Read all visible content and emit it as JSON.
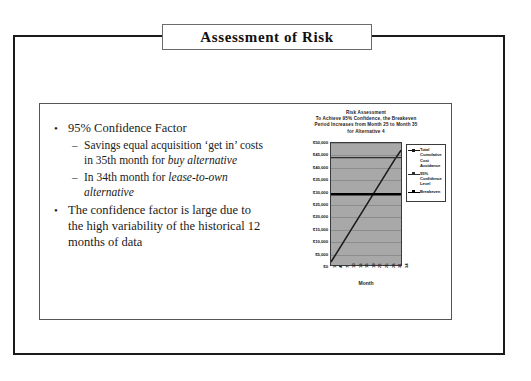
{
  "slide": {
    "title": "Assessment of Risk"
  },
  "bullets": [
    {
      "level": 1,
      "marker": "•",
      "segments": [
        {
          "text": "95% Confidence Factor",
          "style": "normal"
        }
      ]
    },
    {
      "level": 2,
      "marker": "–",
      "segments": [
        {
          "text": "Savings equal acquisition ‘get in’ costs in 35th month for ",
          "style": "normal"
        },
        {
          "text": "buy alternative",
          "style": "italic"
        }
      ]
    },
    {
      "level": 2,
      "marker": "–",
      "segments": [
        {
          "text": "In 34th month for ",
          "style": "normal"
        },
        {
          "text": "lease-to-own alternative",
          "style": "italic"
        }
      ]
    },
    {
      "level": 1,
      "marker": "•",
      "segments": [
        {
          "text": "The confidence factor is large due to the high variability of the historical 12 months of data",
          "style": "normal"
        }
      ]
    }
  ],
  "chart_data": {
    "type": "line",
    "title_lines": [
      "Risk Assessment",
      "To Achieve 95% Confidence, the Breakeven",
      "Period Increases from Month 25 to Month 35",
      "for Alternative 4"
    ],
    "xlabel": "Month",
    "ylabel": "",
    "ylim": [
      0,
      50000
    ],
    "ytick_labels": [
      "$50,000",
      "$45,000",
      "$40,000",
      "$35,000",
      "$30,000",
      "$25,000",
      "$20,000",
      "$15,000",
      "$10,000",
      "$5,000",
      "$0"
    ],
    "ytick_values": [
      50000,
      45000,
      40000,
      35000,
      30000,
      25000,
      20000,
      15000,
      10000,
      5000,
      0
    ],
    "grid": true,
    "legend_position": "right",
    "x": [
      1,
      4,
      7,
      10,
      13,
      16,
      19,
      22,
      25,
      28,
      31,
      34
    ],
    "xtick_labels": [
      "1",
      "4",
      "7",
      "10",
      "13",
      "16",
      "19",
      "22",
      "25",
      "28",
      "31",
      "34"
    ],
    "series": [
      {
        "name": "Total Cumulative Cost Avoidance",
        "color": "#1a1a1a",
        "kind": "diagonal",
        "values": [
          1200,
          5400,
          9600,
          13800,
          18000,
          22200,
          26400,
          30600,
          34800,
          39000,
          43200,
          47000
        ]
      },
      {
        "name": "95% Confidence Level",
        "color": "#2e2e2e",
        "kind": "horizontal",
        "level": 44000
      },
      {
        "name": "Breakeven",
        "color": "#000000",
        "kind": "horizontal-thick",
        "level": 29000
      }
    ]
  }
}
